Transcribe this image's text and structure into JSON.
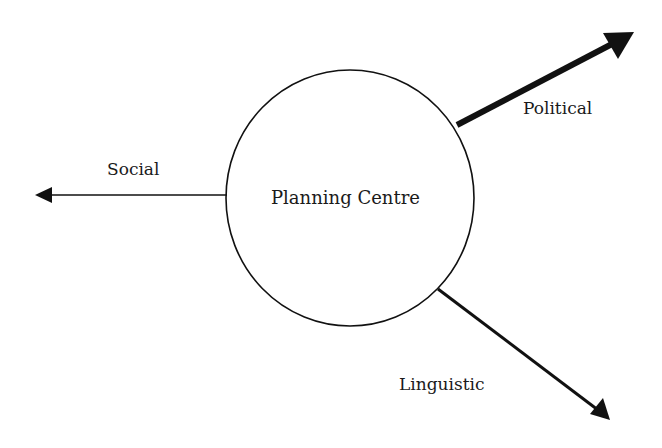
{
  "diagram": {
    "center": {
      "label": "Planning Centre"
    },
    "branches": [
      {
        "label": "Social",
        "direction": "left"
      },
      {
        "label": "Political",
        "direction": "upper-right"
      },
      {
        "label": "Linguistic",
        "direction": "lower-right"
      }
    ]
  },
  "colors": {
    "stroke": "#111111",
    "text": "#1a1a1a",
    "background": "#ffffff"
  }
}
